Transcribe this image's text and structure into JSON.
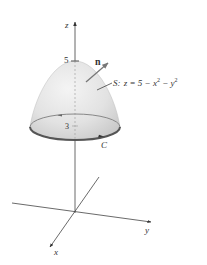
{
  "figure": {
    "axes": {
      "z_label": "z",
      "y_label": "y",
      "x_label": "x"
    },
    "ticks": {
      "z_top": "5",
      "z_rim": "3"
    },
    "surface": {
      "label_prefix": "S:",
      "equation": "z = 5 − x",
      "exp1": "2",
      "minus": " − y",
      "exp2": "2",
      "fill_color": "#e6e6e6"
    },
    "normal": {
      "label": "n"
    },
    "curve": {
      "label": "C",
      "stroke_color": "#555555"
    }
  }
}
